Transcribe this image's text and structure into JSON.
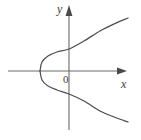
{
  "figure": {
    "background_color": "#ffffff",
    "line_color": "#4d4d4d",
    "axis_color": "#6b6b6b",
    "label_color": "#3d3d3d",
    "labels": {
      "y_axis": "y",
      "x_axis": "x",
      "origin": "0"
    }
  },
  "chart_data": {
    "type": "line",
    "xlabel": "x",
    "ylabel": "y",
    "grid": false,
    "legend": null,
    "annotations": [
      "0"
    ],
    "axes": {
      "x_axis_pixel_y": 71,
      "y_axis_pixel_x": 69,
      "x_axis_pixel_range": [
        8,
        126
      ],
      "y_axis_pixel_range": [
        6,
        130
      ],
      "x_arrow_tip": [
        126,
        71
      ],
      "y_arrow_tip": [
        69,
        6
      ],
      "origin_pixel": [
        69,
        71
      ]
    },
    "curve": {
      "description": "Parabola opening to the right, vertex left of the origin on the x-axis, symmetric about the x-axis",
      "vertex_pixel": [
        40,
        71
      ],
      "y_axis_intersections_pixel": [
        [
          69,
          49
        ],
        [
          69,
          94
        ]
      ],
      "upper_branch_pixel_points": [
        [
          40,
          71
        ],
        [
          42,
          62
        ],
        [
          48,
          56
        ],
        [
          57,
          52
        ],
        [
          69,
          49
        ],
        [
          84,
          41
        ],
        [
          100,
          31
        ],
        [
          114,
          24
        ],
        [
          128,
          18
        ]
      ],
      "lower_branch_pixel_points": [
        [
          40,
          71
        ],
        [
          42,
          80
        ],
        [
          48,
          86
        ],
        [
          57,
          90
        ],
        [
          69,
          94
        ],
        [
          84,
          101
        ],
        [
          100,
          111
        ],
        [
          114,
          117
        ],
        [
          128,
          122
        ]
      ]
    }
  }
}
